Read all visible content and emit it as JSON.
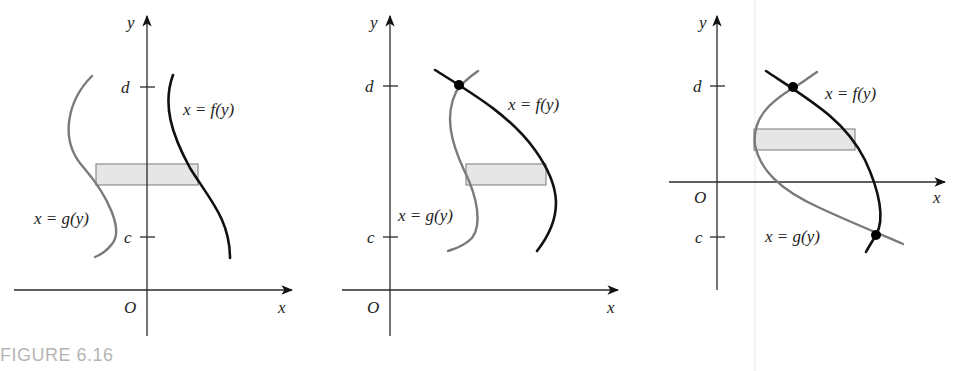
{
  "caption": "FIGURE 6.16",
  "colors": {
    "f_curve": "#111111",
    "g_curve": "#7a7a7a",
    "strip_fill": "#e6e6e6",
    "caption": "#b5b5b5"
  },
  "panels": [
    {
      "id": "panel-1",
      "axis_x_label": "x",
      "axis_y_label": "y",
      "origin_label": "O",
      "tick_top_label": "d",
      "tick_bottom_label": "c",
      "f_label": "x = f(y)",
      "g_label": "x = g(y)",
      "intersection_points": 0
    },
    {
      "id": "panel-2",
      "axis_x_label": "x",
      "axis_y_label": "y",
      "origin_label": "O",
      "tick_top_label": "d",
      "tick_bottom_label": "c",
      "f_label": "x = f(y)",
      "g_label": "x = g(y)",
      "intersection_points": 1
    },
    {
      "id": "panel-3",
      "axis_x_label": "x",
      "axis_y_label": "y",
      "origin_label": "O",
      "tick_top_label": "d",
      "tick_bottom_label": "c",
      "f_label": "x = f(y)",
      "g_label": "x = g(y)",
      "intersection_points": 2
    }
  ]
}
